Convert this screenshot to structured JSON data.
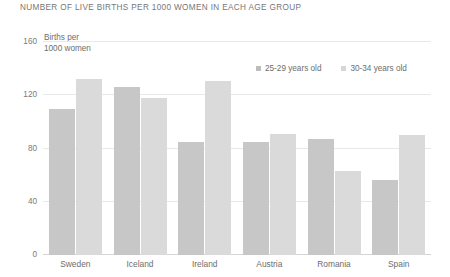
{
  "chart_data": {
    "type": "bar",
    "title": "NUMBER OF LIVE BIRTHS PER 1000 WOMEN IN EACH AGE GROUP",
    "xlabel": "",
    "ylabel": "Births per 1000 women",
    "ylabel_line1": "Births per",
    "ylabel_line2": "1000 women",
    "ylim": [
      0,
      160
    ],
    "yticks": [
      0,
      40,
      80,
      120,
      160
    ],
    "ytick_labels": [
      "0",
      "40",
      "80",
      "120",
      "160"
    ],
    "grid": true,
    "legend_position": "top-right",
    "categories": [
      "Sweden",
      "Iceland",
      "Ireland",
      "Austria",
      "Romania",
      "Spain"
    ],
    "series": [
      {
        "name": "25-29 years old",
        "color": "#c7c7c7",
        "values": [
          110,
          126,
          85,
          85,
          87,
          56
        ]
      },
      {
        "name": "30-34 years old",
        "color": "#dadada",
        "values": [
          132,
          118,
          131,
          91,
          63,
          90
        ]
      }
    ]
  }
}
